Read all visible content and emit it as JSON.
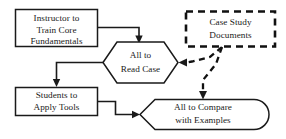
{
  "diagram": {
    "background_color": "#ffffff",
    "line_color": "#1a1a1a",
    "nodes": {
      "instructor": {
        "shape": "rectangle",
        "border": "solid",
        "line1": "Instructor to",
        "line2": "Train Core",
        "line3": "Fundamentals"
      },
      "case_study": {
        "shape": "rectangle",
        "border": "dashed",
        "line1": "Case Study",
        "line2": "Documents"
      },
      "read_case": {
        "shape": "hexagon",
        "border": "solid",
        "line1": "All to",
        "line2": "Read Case"
      },
      "apply_tools": {
        "shape": "rectangle",
        "border": "solid",
        "line1": "Students to",
        "line2": "Apply Tools"
      },
      "compare": {
        "shape": "flag",
        "border": "solid",
        "line1": "All to Compare",
        "line2": "with Examples"
      }
    },
    "connectors": [
      {
        "name": "instructor-to-read-case",
        "style": "solid",
        "from": "instructor",
        "to": "read_case"
      },
      {
        "name": "read-case-to-apply-tools",
        "style": "solid",
        "from": "read_case",
        "to": "apply_tools"
      },
      {
        "name": "apply-tools-to-compare",
        "style": "solid",
        "from": "apply_tools",
        "to": "compare"
      },
      {
        "name": "case-study-to-read-case",
        "style": "dashed",
        "from": "case_study",
        "to": "read_case"
      },
      {
        "name": "case-study-to-compare",
        "style": "dashed",
        "from": "case_study",
        "to": "compare"
      }
    ]
  }
}
